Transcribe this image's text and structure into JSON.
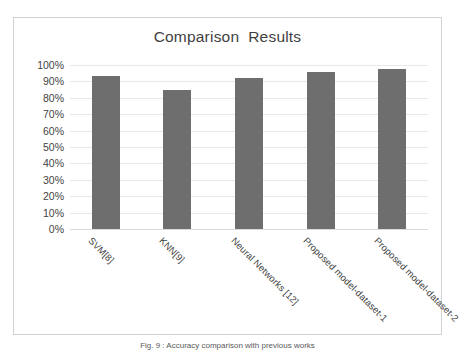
{
  "chart_data": {
    "type": "bar",
    "title": "Comparison  Results",
    "xlabel": "",
    "ylabel": "",
    "categories": [
      "SVM[8]",
      "KNN[9]",
      "Neural Networks [12]",
      "Proposed model-dataset-1",
      "Proposed model-dataset-2"
    ],
    "values": [
      93.5,
      85,
      92,
      96,
      97.5
    ],
    "ylim": [
      0,
      100
    ],
    "ytick_labels": [
      "100%",
      "90%",
      "80%",
      "70%",
      "60%",
      "50%",
      "40%",
      "30%",
      "20%",
      "10%",
      "0%"
    ],
    "ytick_values": [
      100,
      90,
      80,
      70,
      60,
      50,
      40,
      30,
      20,
      10,
      0
    ],
    "grid": true,
    "legend": false,
    "series": [
      {
        "name": "Accuracy",
        "values": [
          93.5,
          85,
          92,
          96,
          97.5
        ]
      }
    ]
  },
  "colors": {
    "bar": "#6e6e6e",
    "grid": "#e8e8e8",
    "frame": "#d2d2d2",
    "text": "#3f3f3f",
    "background": "#ffffff"
  },
  "caption": {
    "text": "Fig. 9 : Accuracy comparison with previous works"
  }
}
